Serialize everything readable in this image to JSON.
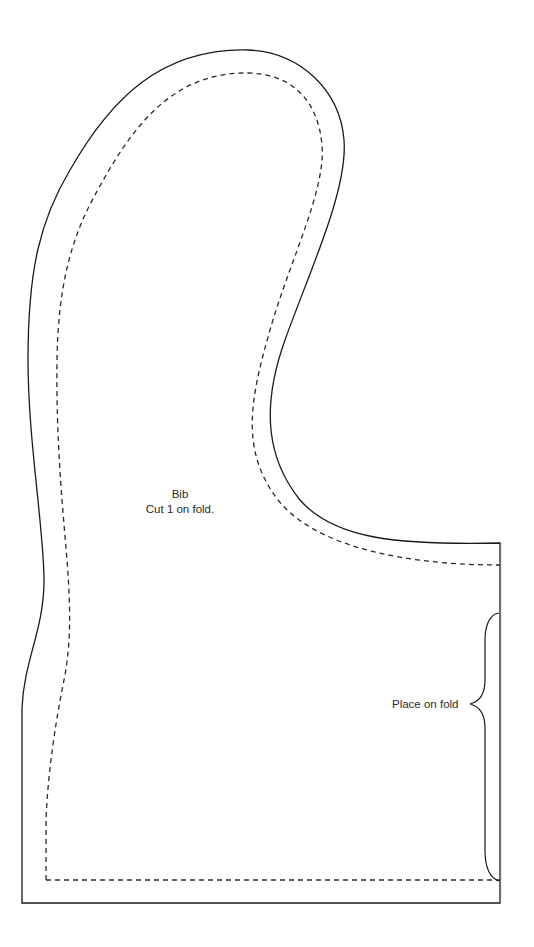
{
  "pattern": {
    "piece_name": "Bib",
    "cut_instruction": "Cut 1 on fold.",
    "fold_label": "Place on fold",
    "colors": {
      "cut_line": "#1a1a1a",
      "seam_line": "#2a2a2a",
      "fold_line": "#9a9a9a",
      "background": "#ffffff"
    },
    "lines": {
      "cut_line": "solid",
      "seam_allowance_line": "dashed",
      "fold_edge": "dotted",
      "fold_bracket": "curly-brace"
    }
  }
}
